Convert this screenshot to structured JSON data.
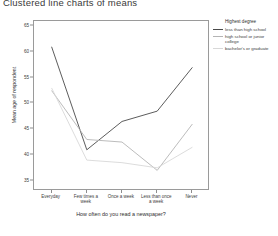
{
  "page": {
    "title": "Clustered line charts of means"
  },
  "legend": {
    "title": "Highest degree",
    "position": "right",
    "items": [
      {
        "label": "less than high school",
        "color": "#4a4a4a"
      },
      {
        "label": "high school or junior college",
        "color": "#b4b4b4"
      },
      {
        "label": "bachelor's or graduate",
        "color": "#d8d8d8"
      }
    ]
  },
  "chart_data": {
    "type": "line",
    "title": "Clustered line charts of means",
    "xlabel": "How often do you read a newspaper?",
    "ylabel": "Mean age of respondent",
    "categories": [
      "Everyday",
      "Few times a week",
      "Once a week",
      "Less than once a week",
      "Never"
    ],
    "yticks": [
      35,
      40,
      45,
      50,
      55,
      60,
      65
    ],
    "ylim": [
      33,
      66
    ],
    "grid": false,
    "legend_title": "Highest degree",
    "series": [
      {
        "name": "less than high school",
        "color": "#4a4a4a",
        "values": [
          61.0,
          41.0,
          46.5,
          48.5,
          57.0
        ]
      },
      {
        "name": "high school or junior college",
        "color": "#b4b4b4",
        "values": [
          52.5,
          43.0,
          42.5,
          37.0,
          46.0
        ]
      },
      {
        "name": "bachelor's or graduate",
        "color": "#d8d8d8",
        "values": [
          53.0,
          39.0,
          38.5,
          37.5,
          41.5
        ]
      }
    ]
  }
}
